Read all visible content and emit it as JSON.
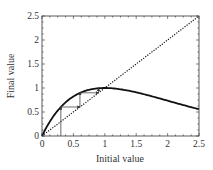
{
  "chart_data": {
    "type": "line",
    "title": "",
    "xlabel": "Initial value",
    "ylabel": "Final value",
    "xlim": [
      0,
      2.5
    ],
    "ylim": [
      0,
      2.5
    ],
    "xticks": [
      "0",
      "0.5",
      "1",
      "1.5",
      "2",
      "2.5"
    ],
    "yticks": [
      "0",
      "0.5",
      "1",
      "1.5",
      "2",
      "2.5"
    ],
    "grid": false,
    "legend": null,
    "series": [
      {
        "name": "map curve",
        "style": "solid-thick",
        "x": [
          0,
          0.1,
          0.2,
          0.3,
          0.4,
          0.5,
          0.6,
          0.7,
          0.8,
          0.9,
          1.0,
          1.25,
          1.5,
          1.75,
          2.0,
          2.25,
          2.5
        ],
        "y": [
          0,
          0.246,
          0.445,
          0.604,
          0.729,
          0.824,
          0.895,
          0.945,
          0.977,
          0.995,
          1.0,
          0.974,
          0.91,
          0.827,
          0.736,
          0.644,
          0.558
        ]
      },
      {
        "name": "identity line y=x",
        "style": "dotted",
        "x": [
          0,
          2.5
        ],
        "y": [
          0,
          2.5
        ]
      },
      {
        "name": "cobweb iteration",
        "style": "thin-arrows",
        "x": [
          0.3,
          0.3,
          0.604,
          0.604,
          0.9,
          0.9
        ],
        "y": [
          0,
          0.604,
          0.604,
          0.9,
          0.9,
          0.995
        ]
      }
    ]
  }
}
